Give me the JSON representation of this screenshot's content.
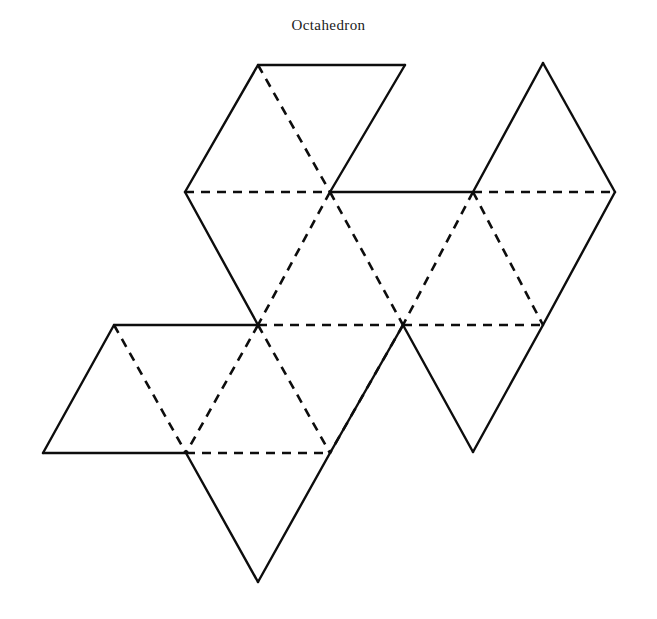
{
  "figure": {
    "title": "Octahedron",
    "kind": "polyhedron-net-diagram",
    "background_color": "#ffffff",
    "line_color": "#0d0d0d",
    "solid_line_meaning": "cut edge (outline)",
    "dashed_line_meaning": "fold edge (interior crease)"
  },
  "chart_data": {
    "type": "diagram",
    "title": "Octahedron",
    "subtitle": "",
    "xlabel": "",
    "ylabel": "",
    "grid": false,
    "legend": [],
    "geometry": {
      "lattice": "equilateral-triangular",
      "edge_length_px": 145,
      "row_spacing_px": 132,
      "vertex_rows": [
        {
          "row": 1,
          "y": 65,
          "x": [
            258,
            403,
            543
          ]
        },
        {
          "row": 2,
          "y": 192,
          "x": [
            185,
            330,
            473,
            615
          ]
        },
        {
          "row": 3,
          "y": 325,
          "x": [
            114,
            258,
            403,
            543
          ]
        },
        {
          "row": 4,
          "y": 453,
          "x": [
            43,
            186,
            330,
            473
          ]
        },
        {
          "row": 5,
          "y": 582,
          "x": [
            258
          ]
        }
      ],
      "solid_edges": [
        [
          258,
          65,
          405,
          65
        ],
        [
          258,
          65,
          185,
          192
        ],
        [
          405,
          65,
          330,
          192
        ],
        [
          185,
          192,
          258,
          325
        ],
        [
          330,
          192,
          473,
          192
        ],
        [
          473,
          192,
          543,
          63
        ],
        [
          543,
          63,
          615,
          192
        ],
        [
          615,
          192,
          543,
          325
        ],
        [
          114,
          325,
          258,
          325
        ],
        [
          114,
          325,
          43,
          453
        ],
        [
          43,
          453,
          186,
          453
        ],
        [
          186,
          453,
          258,
          582
        ],
        [
          258,
          582,
          330,
          453
        ],
        [
          330,
          453,
          403,
          325
        ],
        [
          403,
          325,
          473,
          452
        ],
        [
          473,
          452,
          543,
          325
        ]
      ],
      "dashed_edges": [
        [
          185,
          192,
          330,
          192
        ],
        [
          473,
          192,
          615,
          192
        ],
        [
          258,
          65,
          330,
          192
        ],
        [
          330,
          192,
          258,
          325
        ],
        [
          330,
          192,
          403,
          325
        ],
        [
          473,
          192,
          403,
          325
        ],
        [
          473,
          192,
          543,
          325
        ],
        [
          258,
          325,
          403,
          325
        ],
        [
          403,
          325,
          543,
          325
        ],
        [
          114,
          325,
          186,
          453
        ],
        [
          258,
          325,
          186,
          453
        ],
        [
          258,
          325,
          330,
          453
        ],
        [
          403,
          325,
          330,
          453
        ],
        [
          186,
          453,
          330,
          453
        ]
      ],
      "face_count": 8
    },
    "faces": [
      {
        "id": "face-1",
        "label": "",
        "points": "258,65 405,65 330,192"
      },
      {
        "id": "face-2",
        "label": "",
        "points": "258,65 185,192 330,192"
      },
      {
        "id": "face-3",
        "label": "",
        "points": "185,192 330,192 258,325"
      },
      {
        "id": "face-4",
        "label": "",
        "points": "330,192 258,325 403,325"
      },
      {
        "id": "face-5",
        "label": "",
        "points": "330,192 473,192 403,325"
      },
      {
        "id": "face-6",
        "label": "",
        "points": "473,192 543,63 615,192"
      },
      {
        "id": "face-7",
        "label": "",
        "points": "473,192 615,192 543,325"
      },
      {
        "id": "face-8",
        "label": "",
        "points": "473,192 403,325 543,325"
      },
      {
        "id": "face-9",
        "label": "",
        "points": "114,325 258,325 186,453"
      },
      {
        "id": "face-10",
        "label": "",
        "points": "114,325 43,453 186,453"
      },
      {
        "id": "face-11",
        "label": "",
        "points": "258,325 186,453 330,453"
      },
      {
        "id": "face-12",
        "label": "",
        "points": "258,325 403,325 330,453"
      },
      {
        "id": "face-13",
        "label": "",
        "points": "186,453 330,453 258,582"
      },
      {
        "id": "face-14",
        "label": "",
        "points": "403,325 330,453 473,452"
      },
      {
        "id": "face-15",
        "label": "",
        "points": "403,325 473,452 543,325"
      }
    ]
  }
}
